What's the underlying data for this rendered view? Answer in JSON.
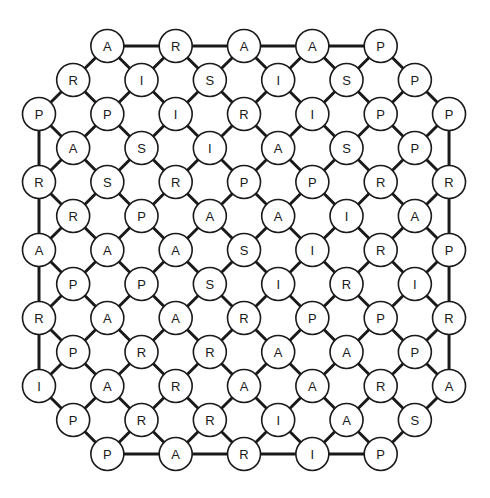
{
  "puzzle": {
    "type": "letter-lattice",
    "rows": [
      [
        "",
        "",
        "A",
        "",
        "R",
        "",
        "A",
        "",
        "A",
        "",
        "P",
        "",
        ""
      ],
      [
        "",
        "R",
        "",
        "I",
        "",
        "S",
        "",
        "I",
        "",
        "S",
        "",
        "P",
        ""
      ],
      [
        "P",
        "",
        "P",
        "",
        "I",
        "",
        "R",
        "",
        "I",
        "",
        "P",
        "",
        "P"
      ],
      [
        "",
        "A",
        "",
        "S",
        "",
        "I",
        "",
        "A",
        "",
        "S",
        "",
        "P",
        ""
      ],
      [
        "R",
        "",
        "S",
        "",
        "R",
        "",
        "P",
        "",
        "P",
        "",
        "R",
        "",
        "R"
      ],
      [
        "",
        "R",
        "",
        "P",
        "",
        "A",
        "",
        "A",
        "",
        "I",
        "",
        "A",
        ""
      ],
      [
        "A",
        "",
        "A",
        "",
        "A",
        "",
        "S",
        "",
        "I",
        "",
        "R",
        "",
        "P"
      ],
      [
        "",
        "P",
        "",
        "P",
        "",
        "S",
        "",
        "I",
        "",
        "R",
        "",
        "I",
        ""
      ],
      [
        "R",
        "",
        "A",
        "",
        "A",
        "",
        "R",
        "",
        "P",
        "",
        "P",
        "",
        "R"
      ],
      [
        "",
        "P",
        "",
        "R",
        "",
        "R",
        "",
        "A",
        "",
        "A",
        "",
        "P",
        ""
      ],
      [
        "I",
        "",
        "A",
        "",
        "R",
        "",
        "A",
        "",
        "A",
        "",
        "R",
        "",
        "A"
      ],
      [
        "",
        "P",
        "",
        "R",
        "",
        "R",
        "",
        "I",
        "",
        "A",
        "",
        "S",
        ""
      ],
      [
        "",
        "",
        "P",
        "",
        "A",
        "",
        "R",
        "",
        "I",
        "",
        "P",
        "",
        ""
      ]
    ],
    "colors": {
      "line": "#1a1a1a",
      "node_fill": "#ffffff",
      "background": "#ffffff"
    }
  }
}
